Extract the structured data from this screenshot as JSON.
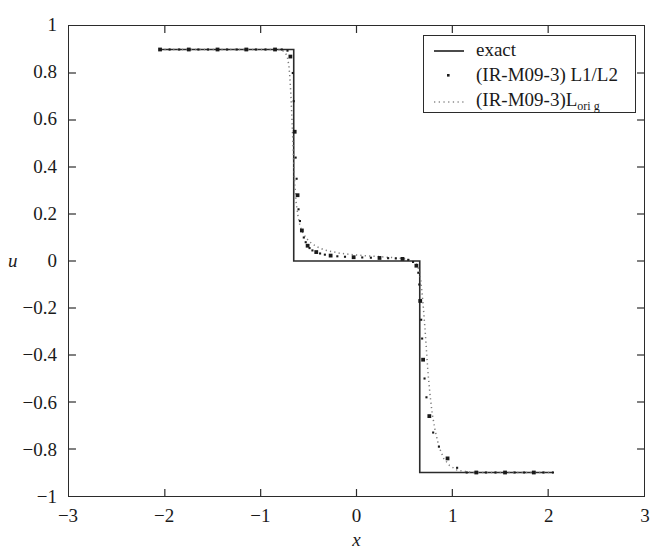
{
  "chart_data": {
    "type": "line",
    "title": "",
    "xlabel": "x",
    "ylabel": "u",
    "xlim": [
      -3,
      3
    ],
    "ylim": [
      -1,
      1
    ],
    "xticks": [
      -3,
      -2,
      -1,
      0,
      1,
      2,
      3
    ],
    "xtick_labels": [
      "−3",
      "−2",
      "−1",
      "0",
      "1",
      "2",
      "3"
    ],
    "yticks": [
      -1,
      -0.8,
      -0.6,
      -0.4,
      -0.2,
      0,
      0.2,
      0.4,
      0.6,
      0.8,
      1
    ],
    "ytick_labels": [
      "−1",
      "−0.8",
      "−0.6",
      "−0.4",
      "−0.2",
      "0",
      "0.2",
      "0.4",
      "0.6",
      "0.8",
      "1"
    ],
    "grid": false,
    "legend_position": "upper right",
    "series": [
      {
        "name": "exact",
        "style": "solid",
        "color": "#2b2b2b",
        "x": [
          -2.05,
          -0.655,
          -0.655,
          0.66,
          0.66,
          2.05
        ],
        "y": [
          0.9,
          0.9,
          0.0,
          0.0,
          -0.9,
          -0.9
        ]
      },
      {
        "name": "(IR-M09-3) L1/L2",
        "style": "markers",
        "marker": "square",
        "color": "#1a1a1a",
        "x": [
          -2.05,
          -1.95,
          -1.85,
          -1.75,
          -1.65,
          -1.55,
          -1.45,
          -1.35,
          -1.25,
          -1.15,
          -1.05,
          -0.95,
          -0.85,
          -0.78,
          -0.72,
          -0.69,
          -0.665,
          -0.655,
          -0.645,
          -0.635,
          -0.625,
          -0.615,
          -0.605,
          -0.59,
          -0.57,
          -0.55,
          -0.53,
          -0.51,
          -0.49,
          -0.46,
          -0.42,
          -0.38,
          -0.33,
          -0.27,
          -0.2,
          -0.12,
          -0.03,
          0.06,
          0.15,
          0.24,
          0.33,
          0.41,
          0.48,
          0.54,
          0.59,
          0.625,
          0.645,
          0.655,
          0.665,
          0.675,
          0.685,
          0.695,
          0.71,
          0.73,
          0.76,
          0.8,
          0.86,
          0.95,
          1.05,
          1.15,
          1.25,
          1.35,
          1.45,
          1.55,
          1.65,
          1.75,
          1.85,
          1.95,
          2.05
        ],
        "y": [
          0.9,
          0.9,
          0.9,
          0.9,
          0.9,
          0.9,
          0.9,
          0.9,
          0.9,
          0.9,
          0.9,
          0.9,
          0.9,
          0.9,
          0.895,
          0.87,
          0.8,
          0.68,
          0.55,
          0.44,
          0.35,
          0.28,
          0.22,
          0.17,
          0.13,
          0.1,
          0.08,
          0.065,
          0.055,
          0.045,
          0.038,
          0.032,
          0.027,
          0.023,
          0.02,
          0.018,
          0.016,
          0.015,
          0.014,
          0.013,
          0.012,
          0.011,
          0.009,
          0.005,
          -0.004,
          -0.02,
          -0.05,
          -0.1,
          -0.17,
          -0.25,
          -0.33,
          -0.42,
          -0.5,
          -0.58,
          -0.66,
          -0.73,
          -0.79,
          -0.84,
          -0.88,
          -0.9,
          -0.9,
          -0.9,
          -0.9,
          -0.9,
          -0.9,
          -0.9,
          -0.9,
          -0.9,
          -0.9
        ]
      },
      {
        "name": "(IR-M09-3)L_orig",
        "name_base": "(IR-M09-3)L",
        "name_sub": "ori g",
        "style": "dotted",
        "color": "#7a7a7a",
        "x": [
          -2.05,
          -1.8,
          -1.5,
          -1.2,
          -1.0,
          -0.9,
          -0.82,
          -0.77,
          -0.74,
          -0.72,
          -0.705,
          -0.695,
          -0.685,
          -0.675,
          -0.665,
          -0.655,
          -0.645,
          -0.63,
          -0.61,
          -0.59,
          -0.56,
          -0.52,
          -0.47,
          -0.41,
          -0.34,
          -0.26,
          -0.17,
          -0.07,
          0.04,
          0.15,
          0.26,
          0.36,
          0.45,
          0.53,
          0.59,
          0.63,
          0.655,
          0.67,
          0.685,
          0.7,
          0.715,
          0.73,
          0.745,
          0.765,
          0.79,
          0.82,
          0.86,
          0.91,
          0.97,
          1.05,
          1.2,
          1.45,
          1.7,
          2.05
        ],
        "y": [
          0.9,
          0.9,
          0.9,
          0.9,
          0.9,
          0.9,
          0.9,
          0.895,
          0.885,
          0.865,
          0.83,
          0.78,
          0.71,
          0.62,
          0.52,
          0.42,
          0.33,
          0.25,
          0.19,
          0.15,
          0.12,
          0.095,
          0.075,
          0.06,
          0.048,
          0.04,
          0.033,
          0.028,
          0.024,
          0.021,
          0.018,
          0.015,
          0.012,
          0.007,
          -0.002,
          -0.016,
          -0.04,
          -0.08,
          -0.14,
          -0.21,
          -0.29,
          -0.38,
          -0.47,
          -0.56,
          -0.65,
          -0.72,
          -0.79,
          -0.84,
          -0.87,
          -0.89,
          -0.9,
          -0.9,
          -0.9,
          -0.9
        ]
      }
    ]
  },
  "legend": {
    "entries": [
      {
        "label": "exact",
        "sample": "solid-line-sample"
      },
      {
        "label": "(IR-M09-3) L1/L2",
        "sample": "dot-marker-sample"
      },
      {
        "label": "(IR-M09-3)L",
        "sublabel": "ori g",
        "sample": "dotted-line-sample"
      }
    ]
  },
  "colors": {
    "axis": "#2b2b2b",
    "exact": "#2b2b2b",
    "markers": "#1a1a1a",
    "dotted": "#7a7a7a",
    "background": "#ffffff"
  }
}
